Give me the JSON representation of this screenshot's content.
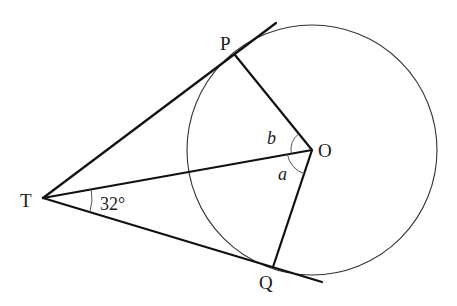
{
  "diagram": {
    "type": "circle-tangent-geometry",
    "points": {
      "T": {
        "label": "T",
        "x": 43,
        "y": 198
      },
      "P": {
        "label": "P",
        "x": 235,
        "y": 55
      },
      "O": {
        "label": "O",
        "x": 312,
        "y": 150
      },
      "Q": {
        "label": "Q",
        "x": 273,
        "y": 267
      }
    },
    "circle": {
      "center": "O",
      "cx": 312,
      "cy": 150,
      "r": 125
    },
    "angles": {
      "angle_T": {
        "label": "32°",
        "at": "T",
        "between": [
          "TO",
          "TQ"
        ]
      },
      "angle_b": {
        "label": "b",
        "at": "O",
        "between": [
          "OP",
          "OT"
        ]
      },
      "angle_a": {
        "label": "a",
        "at": "O",
        "between": [
          "OT",
          "OQ"
        ]
      }
    },
    "colors": {
      "line": "#111111",
      "circle": "#333333",
      "arc": "#555555",
      "background": "#ffffff"
    }
  }
}
